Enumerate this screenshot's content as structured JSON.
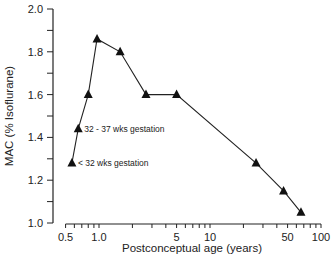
{
  "chart_data": {
    "type": "line",
    "title": "",
    "xlabel": "Postconceptual age (years)",
    "ylabel": "MAC (% Isoflurane)",
    "xscale": "log",
    "xlim": [
      0.5,
      100
    ],
    "ylim": [
      1.0,
      2.0
    ],
    "grid": false,
    "legend": null,
    "x_ticks": [
      0.5,
      1.0,
      5,
      10,
      50,
      100
    ],
    "x_tick_labels": [
      "0.5",
      "1.0",
      "5",
      "10",
      "50",
      "100"
    ],
    "y_ticks": [
      1.0,
      1.2,
      1.4,
      1.6,
      1.8,
      2.0
    ],
    "y_tick_labels": [
      "1.0",
      "1.2",
      "1.4",
      "1.6",
      "1.8",
      "2.0"
    ],
    "marker": "triangle",
    "series": [
      {
        "name": "MAC isoflurane",
        "x": [
          0.57,
          0.65,
          0.8,
          0.96,
          1.55,
          2.65,
          5.0,
          26,
          46,
          66
        ],
        "y": [
          1.28,
          1.44,
          1.6,
          1.86,
          1.8,
          1.6,
          1.6,
          1.28,
          1.15,
          1.05
        ]
      }
    ],
    "annotations": [
      {
        "text": "< 32 wks gestation",
        "x": 0.57,
        "y": 1.28
      },
      {
        "text": "32 - 37 wks gestation",
        "x": 0.65,
        "y": 1.44
      }
    ]
  }
}
